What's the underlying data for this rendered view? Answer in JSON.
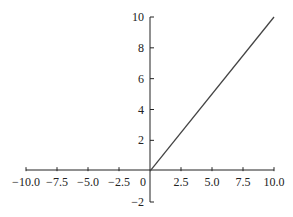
{
  "chart_data": {
    "type": "line",
    "title": "",
    "xlabel": "",
    "ylabel": "",
    "xlim": [
      -10,
      10
    ],
    "ylim": [
      -2,
      10
    ],
    "grid": false,
    "legend": null,
    "x_ticks": [
      -10.0,
      -7.5,
      -5.0,
      -2.5,
      0,
      2.5,
      5.0,
      7.5,
      10.0
    ],
    "x_tick_labels": [
      "−10.0",
      "−7.5",
      "−5.0",
      "−2.5",
      "0",
      "2.5",
      "5.0",
      "7.5",
      "10.0"
    ],
    "y_ticks": [
      -2,
      2,
      4,
      6,
      8,
      10
    ],
    "y_tick_labels": [
      "−2",
      "2",
      "4",
      "6",
      "8",
      "10"
    ],
    "series": [
      {
        "name": "ReLU",
        "x": [
          0,
          10
        ],
        "y": [
          0,
          10
        ],
        "color": "#444444"
      }
    ]
  }
}
